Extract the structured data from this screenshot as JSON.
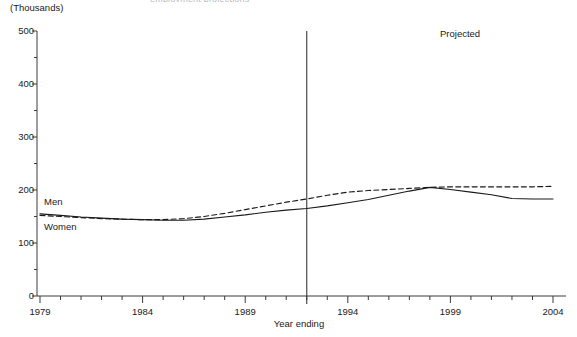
{
  "figure": {
    "cut_title": "employment projections",
    "unit_label": "(Thousands)",
    "xlabel": "Year ending",
    "ylabel": "",
    "annotation": "Projected",
    "series_label_men": "Men",
    "series_label_women": "Women"
  },
  "chart_data": {
    "type": "line",
    "title": "",
    "subtitle": "(Thousands)",
    "xlabel": "Year ending",
    "ylabel": "Thousands",
    "xlim": [
      1979,
      2004
    ],
    "ylim": [
      0,
      500
    ],
    "ytick_values": [
      0,
      100,
      200,
      300,
      400,
      500
    ],
    "ytick_labels": [
      "0",
      "100",
      "200",
      "300",
      "400",
      "500"
    ],
    "yminor_step": 50,
    "xtick_values": [
      1979,
      1984,
      1989,
      1994,
      1999,
      2004
    ],
    "xtick_labels": [
      "1979",
      "1984",
      "1989",
      "1994",
      "1999",
      "2004"
    ],
    "xminor_step": 1,
    "grid": false,
    "legend_position": "inline-left",
    "annotations": [
      {
        "text": "Projected",
        "x": 2000,
        "y": 470
      },
      {
        "text": "Men",
        "x": 1980,
        "y": 178
      },
      {
        "text": "Women",
        "x": 1980,
        "y": 128
      }
    ],
    "projection_divider_x": 1992,
    "x": [
      1979,
      1980,
      1981,
      1982,
      1983,
      1984,
      1985,
      1986,
      1987,
      1988,
      1989,
      1990,
      1991,
      1992,
      1993,
      1994,
      1995,
      1996,
      1997,
      1998,
      1999,
      2000,
      2001,
      2002,
      2003,
      2004
    ],
    "series": [
      {
        "name": "Men",
        "style": "solid",
        "color": "#1a1a1a",
        "values": [
          155,
          152,
          149,
          147,
          145,
          144,
          143,
          143,
          145,
          149,
          153,
          158,
          162,
          165,
          170,
          176,
          182,
          190,
          198,
          205,
          201,
          196,
          191,
          184,
          183,
          183
        ]
      },
      {
        "name": "Women",
        "style": "dashed",
        "color": "#1a1a1a",
        "values": [
          152,
          150,
          148,
          146,
          145,
          144,
          144,
          146,
          150,
          156,
          163,
          170,
          177,
          183,
          190,
          196,
          199,
          201,
          203,
          205,
          206,
          206,
          206,
          206,
          206,
          207
        ]
      }
    ]
  }
}
